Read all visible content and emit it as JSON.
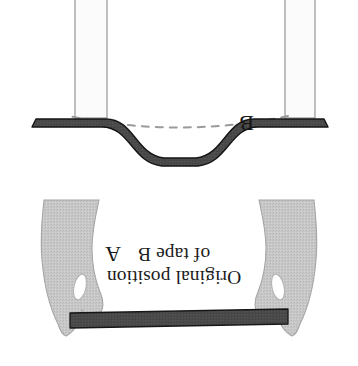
{
  "figure": {
    "caption_line_1": "Original position",
    "caption_line_2": "of tape B",
    "label_a": "A",
    "label_b": "B",
    "orientation": "rotated-180",
    "background_color": "#ffffff"
  },
  "colors": {
    "tape_fill": "#4a4a4a",
    "tape_stroke": "#1a1a1a",
    "hand_fill": "#c6c6c6",
    "hand_stroke": "#a9a9a9",
    "post_fill": "#fbfbfb",
    "post_stroke": "#8c8c8c",
    "dashed_arc": "#9a9a9a",
    "text": "#1c1c1c"
  },
  "elements": {
    "left_post_label": "left-support-post",
    "right_post_label": "right-support-post",
    "dashed_arc_label": "original-position-arc",
    "tape_b_label": "tape-b-sagging",
    "tape_a_label": "tape-a-straight",
    "left_hand_label": "left-hand",
    "right_hand_label": "right-hand"
  }
}
